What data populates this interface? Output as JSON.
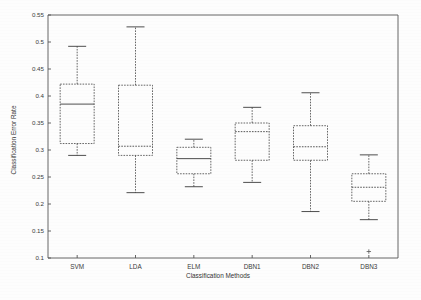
{
  "chart_data": {
    "type": "box",
    "title": "",
    "xlabel": "Classification Methods",
    "ylabel": "Classification Error Rate",
    "categories": [
      "SVM",
      "LDA",
      "ELM",
      "DBN1",
      "DBN2",
      "DBN3"
    ],
    "ylim": [
      0.1,
      0.55
    ],
    "ytick_labels": [
      "0.55",
      "0.5",
      "0.45",
      "0.4",
      "0.35",
      "0.3",
      "0.25",
      "0.2",
      "0.15",
      "0.1"
    ],
    "ytick_values": [
      0.55,
      0.5,
      0.45,
      0.4,
      0.35,
      0.3,
      0.25,
      0.2,
      0.15,
      0.1
    ],
    "grid": false,
    "legend": "none",
    "boxes": [
      {
        "label": "SVM",
        "whisker_low": 0.29,
        "q1": 0.312,
        "median": 0.385,
        "q3": 0.422,
        "whisker_high": 0.492,
        "outliers": []
      },
      {
        "label": "LDA",
        "whisker_low": 0.221,
        "q1": 0.29,
        "median": 0.307,
        "q3": 0.42,
        "whisker_high": 0.528,
        "outliers": []
      },
      {
        "label": "ELM",
        "whisker_low": 0.232,
        "q1": 0.256,
        "median": 0.284,
        "q3": 0.305,
        "whisker_high": 0.32,
        "outliers": []
      },
      {
        "label": "DBN1",
        "whisker_low": 0.24,
        "q1": 0.281,
        "median": 0.334,
        "q3": 0.35,
        "whisker_high": 0.379,
        "outliers": []
      },
      {
        "label": "DBN2",
        "whisker_low": 0.186,
        "q1": 0.281,
        "median": 0.306,
        "q3": 0.345,
        "whisker_high": 0.406,
        "outliers": []
      },
      {
        "label": "DBN3",
        "whisker_low": 0.171,
        "q1": 0.205,
        "median": 0.231,
        "q3": 0.256,
        "whisker_high": 0.291,
        "outliers": [
          0.112
        ]
      }
    ]
  },
  "axes": {
    "y_axis_title": "Classification Error Rate",
    "x_axis_title": "Classification Methods"
  }
}
